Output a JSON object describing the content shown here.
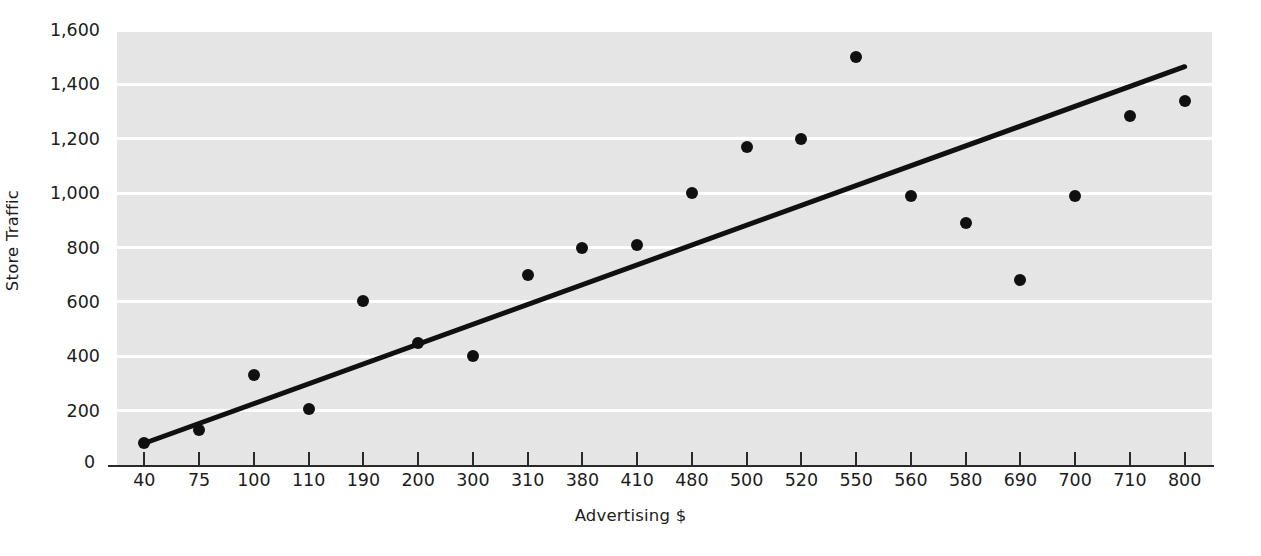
{
  "chart_data": {
    "type": "scatter",
    "title": "",
    "xlabel": "Advertising $",
    "ylabel": "Store Traffic",
    "categories": [
      "40",
      "75",
      "100",
      "110",
      "190",
      "200",
      "300",
      "310",
      "380",
      "410",
      "480",
      "500",
      "520",
      "550",
      "560",
      "580",
      "690",
      "700",
      "710",
      "800"
    ],
    "values": [
      80,
      130,
      330,
      205,
      605,
      450,
      400,
      700,
      800,
      810,
      1000,
      1170,
      1200,
      1500,
      990,
      890,
      680,
      990,
      1285,
      1340
    ],
    "series": [
      {
        "name": "Store Traffic",
        "values": [
          80,
          130,
          330,
          205,
          605,
          450,
          400,
          700,
          800,
          810,
          1000,
          1170,
          1200,
          1500,
          990,
          890,
          680,
          990,
          1285,
          1340
        ]
      }
    ],
    "trendline": {
      "name": "linear-fit",
      "x_start_category": "40",
      "x_end_category": "800",
      "y_start": 80,
      "y_end": 1465
    },
    "ylim": [
      0,
      1600
    ],
    "yticks": [
      0,
      200,
      400,
      600,
      800,
      1000,
      1200,
      1400,
      1600
    ],
    "ytick_labels": [
      "0",
      "200",
      "400",
      "600",
      "800",
      "1,000",
      "1,200",
      "1,400",
      "1,600"
    ],
    "grid": true,
    "grid_axis": "y",
    "legend": false,
    "plot_background_color": "#e4e4e4",
    "gridline_color": "#ffffff",
    "marker_color": "#101010",
    "trendline_color": "#101010"
  }
}
